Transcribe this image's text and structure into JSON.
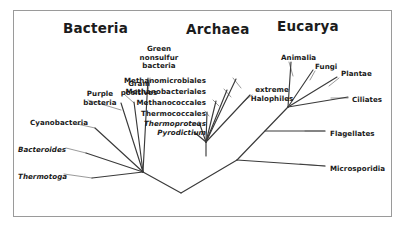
{
  "figure": {
    "type": "phylogenetic-tree",
    "border_color": "#9a9a9a",
    "branch_color": "#3a3a3a",
    "leader_color": "#6e6e6e",
    "background": "#ffffff"
  },
  "domains": [
    {
      "name": "domain-bacteria",
      "label": "Bacteria",
      "x": 63,
      "y": 20
    },
    {
      "name": "domain-archaea",
      "label": "Archaea",
      "x": 186,
      "y": 21
    },
    {
      "name": "domain-eucarya",
      "label": "Eucarya",
      "x": 277,
      "y": 18
    }
  ],
  "taxa": {
    "bacteria": [
      {
        "name": "taxon-thermotoga",
        "label": "Thermotoga",
        "style": "italic",
        "align": "left",
        "x": 18,
        "y": 173
      },
      {
        "name": "taxon-bacteroides",
        "label": "Bacteroides",
        "style": "italic",
        "align": "left",
        "x": 18,
        "y": 146
      },
      {
        "name": "taxon-cyanobacteria",
        "label": "Cyanobacteria",
        "style": "normal",
        "align": "left",
        "x": 30,
        "y": 119
      },
      {
        "name": "taxon-purple-bacteria",
        "label": "Purple\nbacteria",
        "style": "normal",
        "align": "center",
        "x": 71,
        "y": 90
      },
      {
        "name": "taxon-gram-positives",
        "label": "Gram\npositives",
        "style": "normal",
        "align": "center",
        "x": 110,
        "y": 80
      },
      {
        "name": "taxon-green-nonsulfur-bacteria",
        "label": "Green\nnonsulfur\nbacteria",
        "style": "normal",
        "align": "center",
        "x": 130,
        "y": 45
      }
    ],
    "archaea": [
      {
        "name": "taxon-pyrodictium",
        "label": "Pyrodictium",
        "style": "italic",
        "align": "right",
        "x": 146,
        "y": 129
      },
      {
        "name": "taxon-thermoproteus",
        "label": "Thermoproteus",
        "style": "italic",
        "align": "right",
        "x": 146,
        "y": 120
      },
      {
        "name": "taxon-thermococcales",
        "label": "Thermococcales",
        "style": "normal",
        "align": "right",
        "x": 146,
        "y": 110
      },
      {
        "name": "taxon-methanococcales",
        "label": "Methanococcales",
        "style": "normal",
        "align": "right",
        "x": 146,
        "y": 99
      },
      {
        "name": "taxon-methanobacteriales",
        "label": "Methanobacteriales",
        "style": "normal",
        "align": "right",
        "x": 146,
        "y": 88
      },
      {
        "name": "taxon-methanomicrobiales",
        "label": "Methanomicrobiales",
        "style": "normal",
        "align": "right",
        "x": 146,
        "y": 77
      },
      {
        "name": "taxon-extreme-halophiles",
        "label": "extreme\nHalophiles",
        "style": "normal",
        "align": "center",
        "x": 243,
        "y": 86
      }
    ],
    "eucarya": [
      {
        "name": "taxon-animalia",
        "label": "Animalia",
        "style": "normal",
        "align": "left",
        "x": 281,
        "y": 54
      },
      {
        "name": "taxon-fungi",
        "label": "Fungi",
        "style": "normal",
        "align": "left",
        "x": 315,
        "y": 63
      },
      {
        "name": "taxon-plantae",
        "label": "Plantae",
        "style": "normal",
        "align": "left",
        "x": 341,
        "y": 70
      },
      {
        "name": "taxon-ciliates",
        "label": "Ciliates",
        "style": "normal",
        "align": "left",
        "x": 352,
        "y": 96
      },
      {
        "name": "taxon-flagellates",
        "label": "Flagellates",
        "style": "normal",
        "align": "left",
        "x": 330,
        "y": 130
      },
      {
        "name": "taxon-microsporidia",
        "label": "Microsporidia",
        "style": "normal",
        "align": "left",
        "x": 330,
        "y": 165
      }
    ]
  },
  "tree_geometry": {
    "root_stem": {
      "x": 181,
      "y1": 218,
      "y2": 193
    },
    "root_node": {
      "x": 181,
      "y": 193
    },
    "bacteria_node": {
      "x": 143,
      "y": 172
    },
    "archaea_stem_node": {
      "x": 206,
      "y": 156
    },
    "archaea_fan_node": {
      "x": 206,
      "y": 142
    },
    "eucarya_crown_node": {
      "x": 288,
      "y": 107
    },
    "branches": [
      {
        "name": "branch-root-to-bacteria",
        "points": "181,193 143,172"
      },
      {
        "name": "branch-root-to-archaea-eucarya",
        "points": "181,193 237,160"
      },
      {
        "name": "branch-archaea-stem",
        "points": "206,156 206,142"
      },
      {
        "name": "branch-eucarya-stem",
        "points": "237,160 288,107"
      },
      {
        "name": "branch-bact-thermotoga",
        "points": "143,172 92,178"
      },
      {
        "name": "branch-bact-bacteroides",
        "points": "143,172 86,153"
      },
      {
        "name": "branch-bact-cyanobacteria",
        "points": "143,172 95,128"
      },
      {
        "name": "branch-bact-purple",
        "points": "143,172 121,103"
      },
      {
        "name": "branch-bact-gram",
        "points": "143,172 134,102"
      },
      {
        "name": "branch-bact-greennonsulfur",
        "points": "143,172 148,78"
      },
      {
        "name": "branch-arch-pyrodictium",
        "points": "206,142 194,132"
      },
      {
        "name": "branch-arch-thermoproteus",
        "points": "206,142 199,122"
      },
      {
        "name": "branch-arch-thermococcales",
        "points": "206,142 207,112"
      },
      {
        "name": "branch-arch-methanococcales",
        "points": "206,142 216,101"
      },
      {
        "name": "branch-arch-methanobacteriales",
        "points": "206,142 227,90"
      },
      {
        "name": "branch-arch-methanomicrobiales",
        "points": "206,142 236,79"
      },
      {
        "name": "branch-arch-halophiles",
        "points": "206,142 250,95"
      },
      {
        "name": "branch-euc-animalia",
        "points": "288,107 291,62"
      },
      {
        "name": "branch-euc-fungi",
        "points": "288,107 313,70"
      },
      {
        "name": "branch-euc-plantae",
        "points": "288,107 337,77"
      },
      {
        "name": "branch-euc-ciliates",
        "points": "288,107 348,97"
      },
      {
        "name": "branch-euc-flagellates",
        "points": "265,131 325,131"
      },
      {
        "name": "branch-euc-microsporidia",
        "points": "237,160 325,166"
      }
    ],
    "leaders": [
      {
        "name": "leader-thermotoga",
        "points": "64,174 92,178"
      },
      {
        "name": "leader-bacteroides",
        "points": "66,148 86,153"
      },
      {
        "name": "leader-cyanobacteria",
        "points": "77,124 95,128"
      },
      {
        "name": "leader-purple",
        "points": "88,100 121,110"
      },
      {
        "name": "leader-gram",
        "points": "124,94 134,103"
      },
      {
        "name": "leader-greennonsulfur",
        "points": "150,78 148,92"
      },
      {
        "name": "leader-thermoproteus",
        "points": "190,122 199,125"
      },
      {
        "name": "leader-thermococcales",
        "points": "205,111 209,116"
      },
      {
        "name": "leader-methanococcales",
        "points": "213,100 219,106"
      },
      {
        "name": "leader-methanobacteriales",
        "points": "224,89 231,97"
      },
      {
        "name": "leader-methanomicrobiales",
        "points": "233,78 241,88"
      },
      {
        "name": "leader-halophiles",
        "points": "252,95 243,102"
      },
      {
        "name": "leader-animalia",
        "points": "289,62 293,76"
      },
      {
        "name": "leader-fungi",
        "points": "315,71 310,80"
      },
      {
        "name": "leader-plantae",
        "points": "339,78 329,86"
      },
      {
        "name": "leader-ciliates",
        "points": "348,98 331,98"
      },
      {
        "name": "leader-flagellates",
        "points": "325,131 305,131"
      },
      {
        "name": "leader-microsporidia",
        "points": "325,166 300,164"
      }
    ]
  }
}
